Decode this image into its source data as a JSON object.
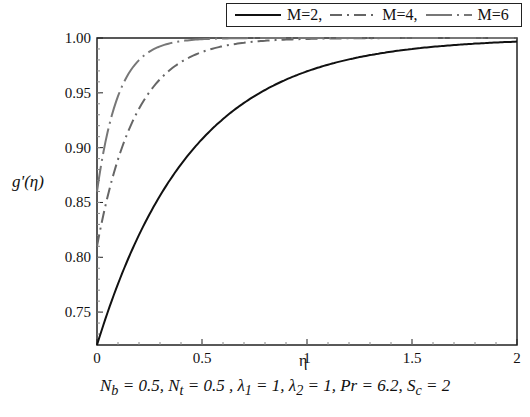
{
  "chart_data": {
    "type": "line",
    "title": "",
    "xlabel": "η",
    "ylabel": "g'(η)",
    "xlim": [
      0,
      2
    ],
    "ylim": [
      0.72,
      1.0
    ],
    "xticks": [
      "0",
      "0.5",
      "1",
      "1.5",
      "2"
    ],
    "yticks": [
      "0.75",
      "0.80",
      "0.85",
      "0.90",
      "0.95",
      "1.00"
    ],
    "grid": false,
    "legend_position": "top",
    "annotation": "N_b = 0.5, N_t = 0.5 , λ_1 = 1, λ_2 = 1, Pr = 6.2, S_c = 2",
    "x": [
      0,
      0.1,
      0.2,
      0.3,
      0.4,
      0.5,
      0.6,
      0.8,
      1.0,
      1.2,
      1.5,
      2.0
    ],
    "series": [
      {
        "name": "M=2",
        "style": "solid",
        "color": "#111111",
        "values": [
          0.72,
          0.777,
          0.822,
          0.857,
          0.886,
          0.908,
          0.926,
          0.952,
          0.969,
          0.98,
          0.99,
          0.997
        ]
      },
      {
        "name": "M=4",
        "style": "dashdot",
        "color": "#666666",
        "values": [
          0.81,
          0.889,
          0.936,
          0.963,
          0.978,
          0.987,
          0.993,
          0.997,
          0.999,
          1.0,
          1.0,
          1.0
        ]
      },
      {
        "name": "M=6",
        "style": "longdash",
        "color": "#777777",
        "values": [
          0.86,
          0.947,
          0.98,
          0.992,
          0.997,
          0.999,
          1.0,
          1.0,
          1.0,
          1.0,
          1.0,
          1.0
        ]
      }
    ]
  },
  "legend": {
    "items": [
      {
        "label": "M=2,"
      },
      {
        "label": "M=4,"
      },
      {
        "label": "M=6"
      }
    ]
  },
  "axes": {
    "ylabel": "g'(η)",
    "xlabel": "η"
  },
  "annotation": {
    "text": "N_b = 0.5, N_t = 0.5 , λ_1 = 1, λ_2 = 1, Pr = 6.2, S_c = 2"
  }
}
